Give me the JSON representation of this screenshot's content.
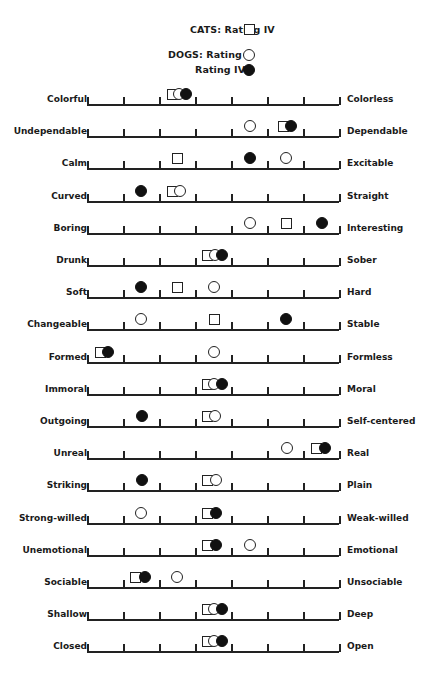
{
  "legend": {
    "cats_label": "CATS:  Rating IV",
    "dogs_label": "DOGS:  Rating I",
    "dogs_label2": "Rating IV",
    "items": [
      {
        "group": "CATS",
        "rating": "Rating IV",
        "marker": "square"
      },
      {
        "group": "DOGS",
        "rating": "Rating I",
        "marker": "open-circle"
      },
      {
        "group": "DOGS",
        "rating": "Rating IV",
        "marker": "filled-circle"
      }
    ]
  },
  "scale": {
    "points": 7,
    "ticks": 8,
    "x_start": 87,
    "x_end": 339,
    "first_baseline_y": 104,
    "row_spacing": 32.2
  },
  "rows": [
    {
      "left": "Colorful",
      "right": "Colorless",
      "square_x": 172,
      "open_x": 179,
      "filled_x": 186
    },
    {
      "left": "Undependable",
      "right": "Dependable",
      "square_x": 283,
      "open_x": 250,
      "filled_x": 291
    },
    {
      "left": "Calm",
      "right": "Excitable",
      "square_x": 177,
      "open_x": 286,
      "filled_x": 250
    },
    {
      "left": "Curved",
      "right": "Straight",
      "square_x": 172,
      "open_x": 180,
      "filled_x": 141
    },
    {
      "left": "Boring",
      "right": "Interesting",
      "square_x": 286,
      "open_x": 250,
      "filled_x": 322
    },
    {
      "left": "Drunk",
      "right": "Sober",
      "square_x": 207,
      "open_x": 215,
      "filled_x": 222
    },
    {
      "left": "Soft",
      "right": "Hard",
      "square_x": 177,
      "open_x": 214,
      "filled_x": 141
    },
    {
      "left": "Changeable",
      "right": "Stable",
      "square_x": 214,
      "open_x": 141,
      "filled_x": 286
    },
    {
      "left": "Formed",
      "right": "Formless",
      "square_x": 100,
      "open_x": 214,
      "filled_x": 108
    },
    {
      "left": "Immoral",
      "right": "Moral",
      "square_x": 207,
      "open_x": 214,
      "filled_x": 222
    },
    {
      "left": "Outgoing",
      "right": "Self-centered",
      "square_x": 207,
      "open_x": 215,
      "filled_x": 142
    },
    {
      "left": "Unreal",
      "right": "Real",
      "square_x": 316,
      "open_x": 287,
      "filled_x": 325
    },
    {
      "left": "Striking",
      "right": "Plain",
      "square_x": 207,
      "open_x": 216,
      "filled_x": 142
    },
    {
      "left": "Strong-willed",
      "right": "Weak-willed",
      "square_x": 207,
      "open_x": 141,
      "filled_x": 216
    },
    {
      "left": "Unemotional",
      "right": "Emotional",
      "square_x": 207,
      "open_x": 250,
      "filled_x": 216
    },
    {
      "left": "Sociable",
      "right": "Unsociable",
      "square_x": 135,
      "open_x": 177,
      "filled_x": 145
    },
    {
      "left": "Shallow",
      "right": "Deep",
      "square_x": 207,
      "open_x": 214,
      "filled_x": 222
    },
    {
      "left": "Closed",
      "right": "Open",
      "square_x": 207,
      "open_x": 214,
      "filled_x": 222
    }
  ],
  "chart_data": {
    "type": "scatter",
    "title": "",
    "subtitle": "Semantic differential profile: CATS Rating IV vs DOGS Rating I and Rating IV",
    "xlabel": "",
    "ylabel": "",
    "xlim": [
      1,
      8
    ],
    "scale_points": 7,
    "grid": false,
    "legend_position": "top-center",
    "legend": [
      "CATS: Rating IV (square)",
      "DOGS: Rating I (open circle)",
      "DOGS: Rating IV (filled circle)"
    ],
    "categories": [
      "Colorful–Colorless",
      "Undependable–Dependable",
      "Calm–Excitable",
      "Curved–Straight",
      "Boring–Interesting",
      "Drunk–Sober",
      "Soft–Hard",
      "Changeable–Stable",
      "Formed–Formless",
      "Immoral–Moral",
      "Outgoing–Self-centered",
      "Unreal–Real",
      "Striking–Plain",
      "Strong-willed–Weak-willed",
      "Unemotional–Emotional",
      "Sociable–Unsociable",
      "Shallow–Deep",
      "Closed–Open"
    ],
    "series": [
      {
        "name": "CATS: Rating IV",
        "marker": "square",
        "values": [
          3.4,
          6.4,
          3.5,
          3.4,
          6.5,
          4.3,
          3.5,
          4.5,
          1.4,
          4.3,
          4.3,
          7.4,
          4.3,
          4.3,
          4.3,
          2.3,
          4.3,
          4.3
        ]
      },
      {
        "name": "DOGS: Rating I",
        "marker": "open-circle",
        "values": [
          3.6,
          5.5,
          6.5,
          3.6,
          5.5,
          4.6,
          4.5,
          2.5,
          4.5,
          4.5,
          4.6,
          6.6,
          4.6,
          2.5,
          5.5,
          3.5,
          4.5,
          4.5
        ]
      },
      {
        "name": "DOGS: Rating IV",
        "marker": "filled-circle",
        "values": [
          3.75,
          6.7,
          5.5,
          2.5,
          7.5,
          4.75,
          2.5,
          6.5,
          1.6,
          4.75,
          2.5,
          7.6,
          2.5,
          4.6,
          4.6,
          2.6,
          4.75,
          4.75
        ]
      }
    ]
  }
}
